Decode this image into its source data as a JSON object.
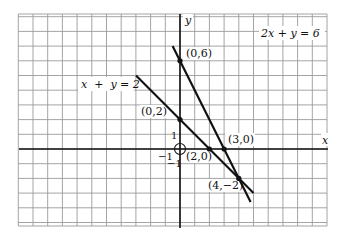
{
  "chart_data": {
    "type": "line",
    "title": "",
    "xlabel": "x",
    "ylabel": "y",
    "grid": true,
    "xlim": [
      -11,
      10
    ],
    "ylim": [
      -5,
      9
    ],
    "series": [
      {
        "name": "x + y = 2",
        "equation": "x + y = 2",
        "x": [
          -3,
          5
        ],
        "y": [
          5,
          -3
        ]
      },
      {
        "name": "2x + y = 6",
        "equation": "2x + y = 6",
        "x": [
          -0.5,
          4.8
        ],
        "y": [
          7,
          -3.6
        ]
      }
    ],
    "points": [
      {
        "label": "(0,6)",
        "x": 0,
        "y": 6
      },
      {
        "label": "(0,2)",
        "x": 0,
        "y": 2
      },
      {
        "label": "(2,0)",
        "x": 2,
        "y": 0
      },
      {
        "label": "(3,0)",
        "x": 3,
        "y": 0
      },
      {
        "label": "(4,−2)",
        "x": 4,
        "y": -2
      }
    ],
    "annotations": [
      "1",
      "−1",
      "−1"
    ]
  },
  "labels": {
    "x_axis": "x",
    "y_axis": "y",
    "eq1": "x  +  y = 2",
    "eq2": "2x + y = 6",
    "p06": "(0,6)",
    "p02": "(0,2)",
    "p20": "(2,0)",
    "p30": "(3,0)",
    "p4m2": "(4,−2)",
    "tick_y1": "1",
    "tick_xm1": "−1",
    "tick_ym1": "−1"
  },
  "colors": {
    "grid": "#9a9a9a",
    "axis": "#111111",
    "line": "#111111",
    "bg": "#ffffff"
  }
}
